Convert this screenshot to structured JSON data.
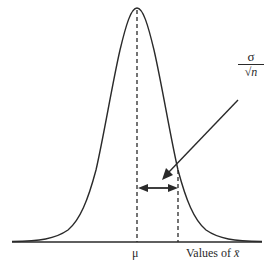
{
  "diagram": {
    "type": "sampling-distribution",
    "curve": {
      "kind": "normal",
      "color": "#2a2a2a"
    },
    "labels": {
      "mean": "μ",
      "x_axis": "Values of x̄",
      "x_axis_prefix": "Values of ",
      "x_axis_symbol": "x̄",
      "annotation_numerator": "σ",
      "annotation_denominator": "√n"
    },
    "annotation": {
      "meaning": "standard error",
      "formula": "σ/√n"
    },
    "colors": {
      "ink": "#2a2a2a",
      "background": "#ffffff"
    }
  }
}
